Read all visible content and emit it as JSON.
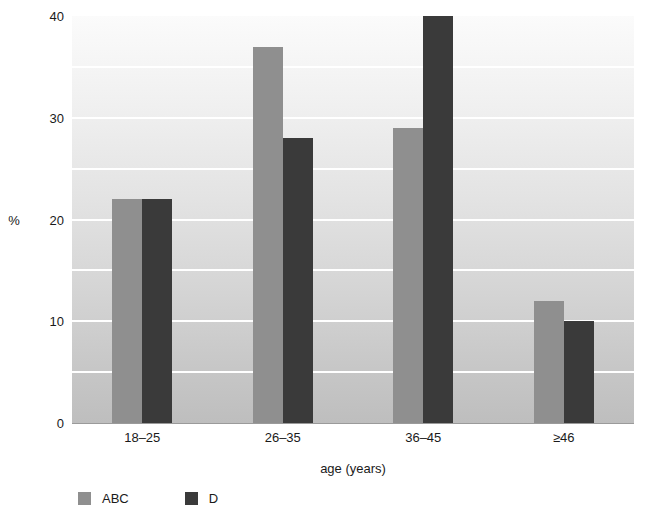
{
  "chart_data": {
    "type": "bar",
    "title": "",
    "subtitle": "",
    "xlabel": "age (years)",
    "ylabel": "%",
    "categories": [
      "18–25",
      "26–35",
      "36–45",
      "≥46"
    ],
    "series": [
      {
        "name": "ABC",
        "color": "#8f8f8f",
        "values": [
          22,
          37,
          29,
          12
        ]
      },
      {
        "name": "D",
        "color": "#3a3a3a",
        "values": [
          22,
          28,
          40,
          10
        ]
      }
    ],
    "ylim": [
      0,
      40
    ],
    "y_ticks": [
      0,
      10,
      20,
      30,
      40
    ],
    "y_tick_labels": [
      "0",
      "10",
      "20",
      "30",
      "40"
    ],
    "gridlines": [
      5,
      10,
      15,
      20,
      25,
      30,
      35
    ],
    "grid": true,
    "grid_color": "#ffffff",
    "legend_position": "bottom-left",
    "plot_background": {
      "type": "vertical-gradient",
      "top": "#fbfbfb",
      "bottom": "#bebebe"
    },
    "axis_color": "#9a9a9a",
    "text_color": "#1a1a1a"
  },
  "axes": {
    "y_axis_title": "%",
    "x_axis_title": "age (years)"
  },
  "legend": {
    "items": [
      {
        "label": "ABC",
        "color": "#8f8f8f"
      },
      {
        "label": "D",
        "color": "#3a3a3a"
      }
    ]
  }
}
